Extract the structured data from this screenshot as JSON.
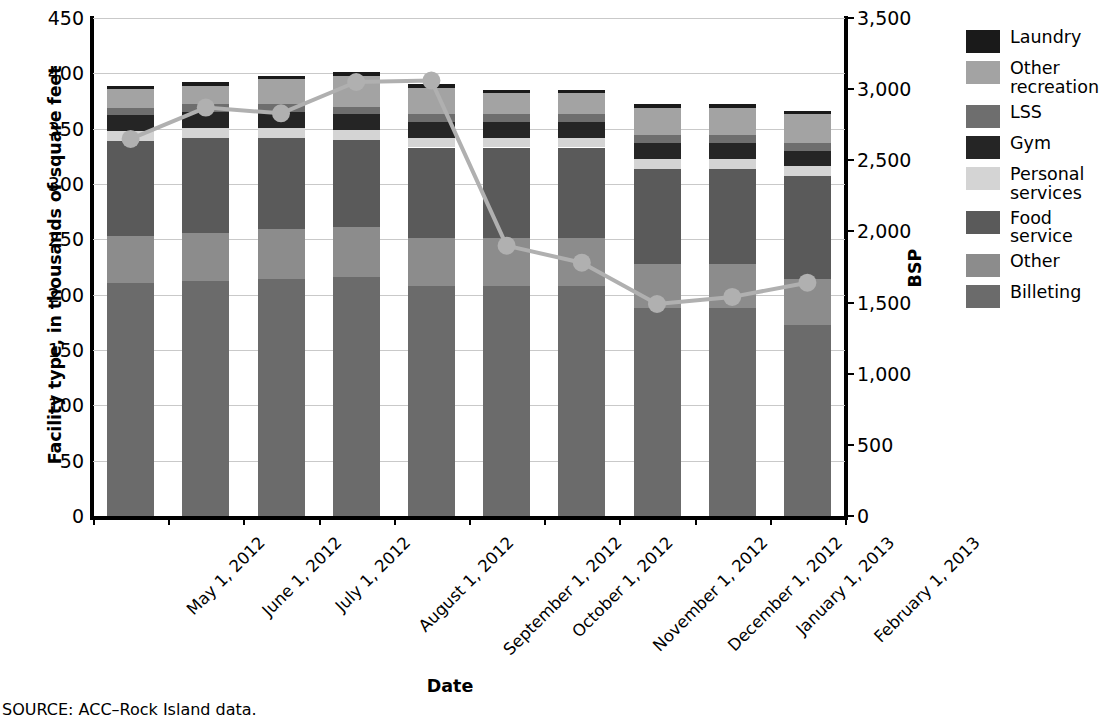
{
  "source_note": "SOURCE: ACC–Rock Island data.",
  "axes": {
    "y_left_title": "Facility type, in thousands of square feet",
    "y_right_title": "BSP",
    "x_title": "Date",
    "y_left_ticks": [
      "0",
      "50",
      "100",
      "150",
      "200",
      "250",
      "300",
      "350",
      "400",
      "450"
    ],
    "y_right_ticks": [
      "0",
      "500",
      "1,000",
      "1,500",
      "2,000",
      "2,500",
      "3,000",
      "3,500"
    ]
  },
  "legend": {
    "items": [
      {
        "label": "Laundry",
        "color": "#1a1a1a"
      },
      {
        "label": "Other recreation",
        "color": "#a3a3a3"
      },
      {
        "label": "LSS",
        "color": "#6e6e6e"
      },
      {
        "label": "Gym",
        "color": "#252525"
      },
      {
        "label": "Personal services",
        "color": "#d4d4d4"
      },
      {
        "label": "Food service",
        "color": "#5a5a5a"
      },
      {
        "label": "Other",
        "color": "#8c8c8c"
      },
      {
        "label": "Billeting",
        "color": "#6b6b6b"
      }
    ]
  },
  "chart_data": {
    "type": "bar",
    "title": "",
    "xlabel": "Date",
    "ylabel": "Facility type, in thousands of square feet",
    "y2label": "BSP",
    "ylim": [
      0,
      450
    ],
    "y2lim": [
      0,
      3500
    ],
    "grid": true,
    "legend_position": "right",
    "stacked": true,
    "categories": [
      "May 1, 2012",
      "June 1, 2012",
      "July 1, 2012",
      "August 1, 2012",
      "September 1, 2012",
      "October 1, 2012",
      "November 1, 2012",
      "December 1, 2012",
      "January 1, 2013",
      "February 1, 2013"
    ],
    "series": [
      {
        "name": "Billeting",
        "color": "#6b6b6b",
        "values": [
          211,
          212,
          214,
          216,
          208,
          208,
          208,
          188,
          188,
          173
        ]
      },
      {
        "name": "Other",
        "color": "#8c8c8c",
        "values": [
          42,
          44,
          45,
          45,
          43,
          43,
          43,
          40,
          40,
          41
        ]
      },
      {
        "name": "Food service",
        "color": "#5a5a5a",
        "values": [
          86,
          86,
          83,
          79,
          82,
          82,
          82,
          86,
          86,
          93
        ]
      },
      {
        "name": "Personal services",
        "color": "#d4d4d4",
        "values": [
          9,
          9,
          9,
          9,
          9,
          9,
          9,
          9,
          9,
          9
        ]
      },
      {
        "name": "Gym",
        "color": "#252525",
        "values": [
          14,
          14,
          14,
          14,
          14,
          14,
          14,
          14,
          14,
          14
        ]
      },
      {
        "name": "LSS",
        "color": "#6e6e6e",
        "values": [
          7,
          7,
          7,
          7,
          7,
          7,
          7,
          7,
          7,
          7
        ]
      },
      {
        "name": "Other recreation",
        "color": "#a3a3a3",
        "values": [
          17,
          17,
          23,
          28,
          24,
          19,
          19,
          25,
          25,
          26
        ]
      },
      {
        "name": "Laundry",
        "color": "#1a1a1a",
        "values": [
          3,
          3,
          3,
          3,
          3,
          3,
          3,
          3,
          3,
          3
        ]
      }
    ],
    "stack_totals": [
      389,
      392,
      398,
      401,
      390,
      385,
      385,
      372,
      372,
      366
    ],
    "line_series": {
      "name": "BSP",
      "color": "#b0b0b0",
      "axis": "y2",
      "marker": "circle",
      "values": [
        2650,
        2870,
        2830,
        3050,
        3060,
        1900,
        1780,
        1490,
        1540,
        1640
      ]
    }
  }
}
